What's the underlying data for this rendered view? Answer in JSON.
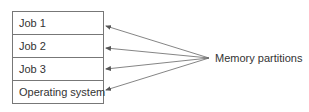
{
  "diagram": {
    "partitions": [
      {
        "label": "Job 1"
      },
      {
        "label": "Job 2"
      },
      {
        "label": "Job 3"
      },
      {
        "label": "Operating system"
      }
    ],
    "annotation": "Memory partitions",
    "colors": {
      "line": "#666666",
      "text": "#333333",
      "border": "#777777"
    }
  }
}
